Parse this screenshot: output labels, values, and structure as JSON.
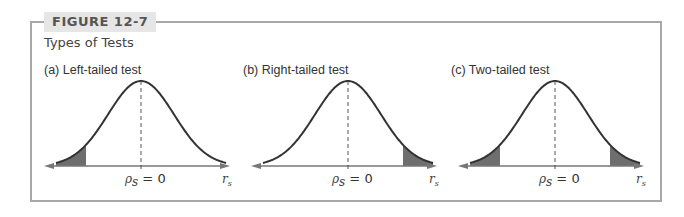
{
  "figure": {
    "label": "FIGURE 12-7",
    "title": "Types of Tests"
  },
  "panels": [
    {
      "label": "(a)  Left-tailed test",
      "shade": "left"
    },
    {
      "label": "(b)  Right-tailed test",
      "shade": "right"
    },
    {
      "label": "(c)  Two-tailed test",
      "shade": "both"
    }
  ],
  "axis": {
    "center_label_sym": "ρ",
    "center_label_sub": "s",
    "center_label_eq": " = 0",
    "x_label_sym": "r",
    "x_label_sub": "s"
  },
  "colors": {
    "frame": "#a8a8a8",
    "curve": "#333333",
    "shade": "#6e6e6e",
    "label_bg": "#e6e6e6"
  }
}
